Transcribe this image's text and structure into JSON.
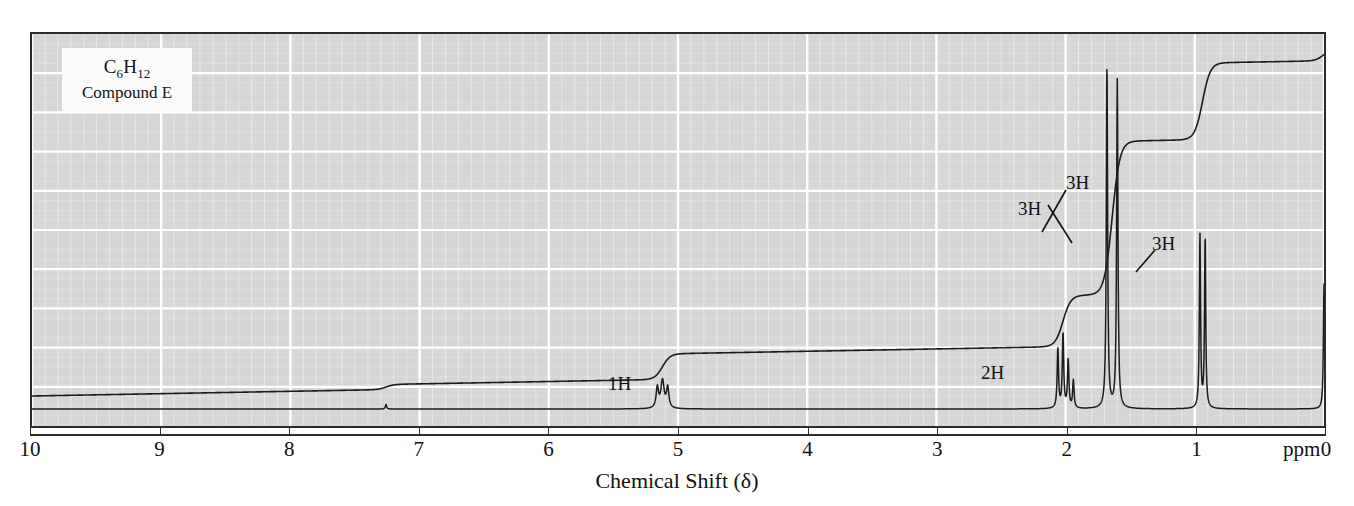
{
  "figure": {
    "kind": "nmr-spectrum",
    "background_color": "#d6d6d6",
    "grid_color": "#ffffff",
    "trace_color": "#1c1c1c",
    "frame_color": "#2b2b2b"
  },
  "compound_label": {
    "formula_parts": [
      "C",
      "6",
      "H",
      "12"
    ],
    "formula_text": "C6H12",
    "name": "Compound E"
  },
  "axis": {
    "title": "Chemical Shift (δ)",
    "unit": "ppm",
    "ticks": [
      10,
      9,
      8,
      7,
      6,
      5,
      4,
      3,
      2,
      1,
      0
    ],
    "tick_labels": [
      "10",
      "9",
      "8",
      "7",
      "6",
      "5",
      "4",
      "3",
      "2",
      "1",
      "0"
    ],
    "min": 0,
    "max": 10,
    "direction": "reversed"
  },
  "integration_labels": [
    {
      "text": "1H",
      "ppm": 5.1,
      "x": 608,
      "y": 373
    },
    {
      "text": "2H",
      "ppm": 2.0,
      "x": 981,
      "y": 362
    },
    {
      "text": "3H",
      "ppm": 1.65,
      "x": 1018,
      "y": 198
    },
    {
      "text": "3H",
      "ppm": 1.58,
      "x": 1066,
      "y": 172
    },
    {
      "text": "3H",
      "ppm": 0.92,
      "x": 1152,
      "y": 233
    }
  ],
  "chart_data": {
    "type": "line",
    "title": "",
    "xlabel": "Chemical Shift (δ)",
    "ylabel": "",
    "xlim": [
      10,
      0
    ],
    "ylim": [
      0,
      1
    ],
    "grid": true,
    "legend": "none",
    "series": [
      {
        "name": "spectrum",
        "description": "1H NMR absorption trace",
        "peaks": [
          {
            "ppm": 7.26,
            "height": 0.012,
            "width": 0.012,
            "assignment": "residual CHCl3",
            "integration": null
          },
          {
            "ppm": 5.12,
            "height": 0.075,
            "width": 0.03,
            "assignment": "vinyl CH",
            "integration": "1H"
          },
          {
            "ppm": 5.16,
            "height": 0.055,
            "width": 0.022,
            "assignment": "vinyl CH",
            "integration": null
          },
          {
            "ppm": 5.08,
            "height": 0.055,
            "width": 0.022,
            "assignment": "vinyl CH",
            "integration": null
          },
          {
            "ppm": 2.06,
            "height": 0.16,
            "width": 0.013,
            "assignment": "allylic CH2",
            "integration": "2H"
          },
          {
            "ppm": 2.02,
            "height": 0.2,
            "width": 0.013,
            "assignment": "allylic CH2",
            "integration": null
          },
          {
            "ppm": 1.98,
            "height": 0.13,
            "width": 0.013,
            "assignment": "allylic CH2",
            "integration": null
          },
          {
            "ppm": 1.94,
            "height": 0.075,
            "width": 0.013,
            "assignment": "allylic CH2",
            "integration": null
          },
          {
            "ppm": 1.68,
            "height": 0.93,
            "width": 0.012,
            "assignment": "vinyl CH3",
            "integration": "3H"
          },
          {
            "ppm": 1.6,
            "height": 0.89,
            "width": 0.012,
            "assignment": "vinyl CH3",
            "integration": "3H"
          },
          {
            "ppm": 0.96,
            "height": 0.47,
            "width": 0.011,
            "assignment": "CH3 doublet",
            "integration": "3H"
          },
          {
            "ppm": 0.92,
            "height": 0.46,
            "width": 0.011,
            "assignment": "CH3 doublet",
            "integration": null
          },
          {
            "ppm": 0.0,
            "height": 0.34,
            "width": 0.011,
            "assignment": "TMS",
            "integration": null
          }
        ]
      },
      {
        "name": "integration",
        "description": "stepped integral curve, rising right-to-left baseline at left",
        "steps": [
          {
            "ppm": 7.26,
            "rise": 0.012
          },
          {
            "ppm": 5.12,
            "rise": 0.06
          },
          {
            "ppm": 2.02,
            "rise": 0.12
          },
          {
            "ppm": 1.64,
            "rise": 0.36
          },
          {
            "ppm": 0.94,
            "rise": 0.18
          },
          {
            "ppm": 0.0,
            "rise": 0.03
          }
        ]
      }
    ]
  }
}
